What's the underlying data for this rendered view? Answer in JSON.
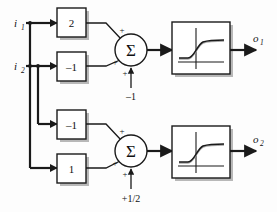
{
  "diagram": {
    "inputs": [
      {
        "id": "i1",
        "label": "i",
        "subscript": "1"
      },
      {
        "id": "i2",
        "label": "i",
        "subscript": "2"
      }
    ],
    "outputs": [
      {
        "id": "o1",
        "label": "o",
        "subscript": "1"
      },
      {
        "id": "o2",
        "label": "o",
        "subscript": "2"
      }
    ],
    "weights": [
      {
        "id": "w11",
        "value": "2",
        "from": "i1",
        "to": "sum1"
      },
      {
        "id": "w21",
        "value": "–1",
        "from": "i2",
        "to": "sum1"
      },
      {
        "id": "w12",
        "value": "–1",
        "from": "i2",
        "to": "sum2"
      },
      {
        "id": "w22",
        "value": "1",
        "from": "i1",
        "to": "sum2"
      }
    ],
    "summers": [
      {
        "id": "sum1",
        "symbol": "Σ",
        "signs": [
          "+",
          "+",
          "+"
        ],
        "bias": "–1"
      },
      {
        "id": "sum2",
        "symbol": "Σ",
        "signs": [
          "+",
          "+",
          "+"
        ],
        "bias": "+1/2"
      }
    ],
    "activations": [
      {
        "id": "act1",
        "kind": "sigmoid"
      },
      {
        "id": "act2",
        "kind": "sigmoid"
      }
    ],
    "colors": {
      "line": "#1a1a1a",
      "shadow": "#b8b8b8",
      "background": "#ffffff",
      "text": "#111111"
    }
  }
}
